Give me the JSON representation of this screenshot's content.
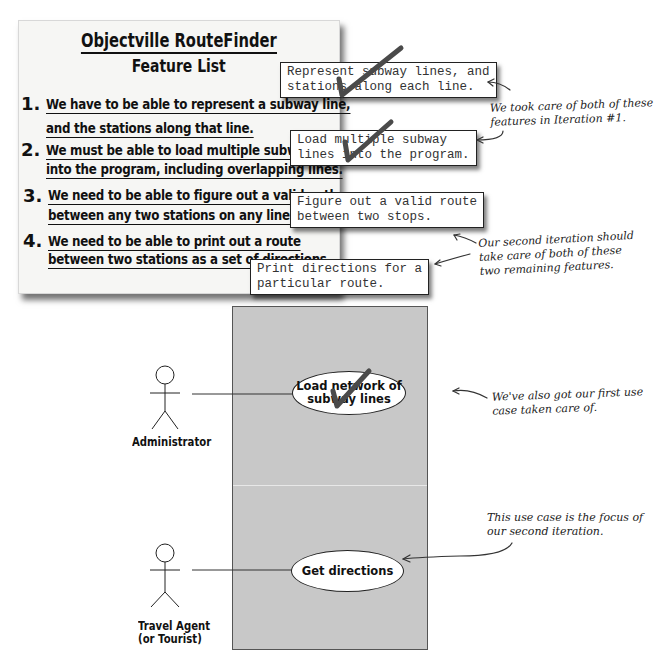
{
  "feature_list": {
    "title": "Objectville RouteFinder",
    "subtitle": "Feature List",
    "items": [
      {
        "number": "1.",
        "line1": "We have to be able to represent a subway line,",
        "line2": "and the stations along that line."
      },
      {
        "number": "2.",
        "line1": "We must be able to load multiple subway lin",
        "line2": "into the program, including overlapping lines."
      },
      {
        "number": "3.",
        "line1": "We need to be able to figure out a valid path",
        "line2": "between any two stations on any lines."
      },
      {
        "number": "4.",
        "line1": "We need to be able to print out a route",
        "line2": "between two stations as a set of directions."
      }
    ]
  },
  "sticky_notes": [
    {
      "line1": "Represent subway lines, and",
      "line2": "stations along each line.",
      "checked": true
    },
    {
      "line1": "Load multiple subway",
      "line2": "lines into the program.",
      "checked": true
    },
    {
      "line1": "Figure out a valid route",
      "line2": "between two stops.",
      "checked": false
    },
    {
      "line1": "Print directions for a",
      "line2": "particular route.",
      "checked": false
    }
  ],
  "annotations": {
    "iteration1": {
      "line1": "We took care of both of these",
      "line2": "features in Iteration #1."
    },
    "iteration2": {
      "line1": "Our second iteration should",
      "line2": "take care of both of these",
      "line3": "two remaining features."
    },
    "first_use_case": {
      "line1": "We've also got our first use",
      "line2": "case taken care of."
    },
    "focus": {
      "line1": "This use case is the focus of",
      "line2": "our second iteration."
    }
  },
  "use_case_diagram": {
    "actors": [
      {
        "name": "Administrator"
      },
      {
        "name_line1": "Travel Agent",
        "name_line2": "(or Tourist)"
      }
    ],
    "use_cases": [
      {
        "line1": "Load network of",
        "line2": "subway lines",
        "checked": true
      },
      {
        "line1": "Get directions",
        "checked": false
      }
    ]
  },
  "colors": {
    "paper": "#f6f6f4",
    "system_box": "#c8c8c8",
    "checkmark": "#444444",
    "ink": "#111111"
  }
}
